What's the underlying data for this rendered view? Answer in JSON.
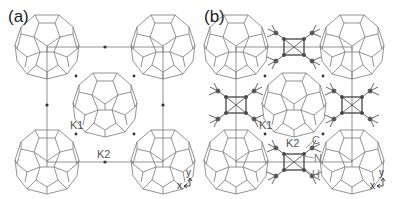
{
  "panels": [
    {
      "label": "(a)",
      "lattice_labels": {
        "k1": "K1",
        "k2": "K2"
      },
      "axes": {
        "x": "x",
        "y": "y"
      }
    },
    {
      "label": "(b)",
      "lattice_labels": {
        "k1": "K1",
        "k2": "K2"
      },
      "atom_labels": {
        "c": "C",
        "n": "N",
        "h": "H"
      },
      "axes": {
        "x": "x",
        "y": "y"
      }
    }
  ],
  "colors": {
    "line": "#777777",
    "dot": "#333333",
    "text": "#222222"
  }
}
